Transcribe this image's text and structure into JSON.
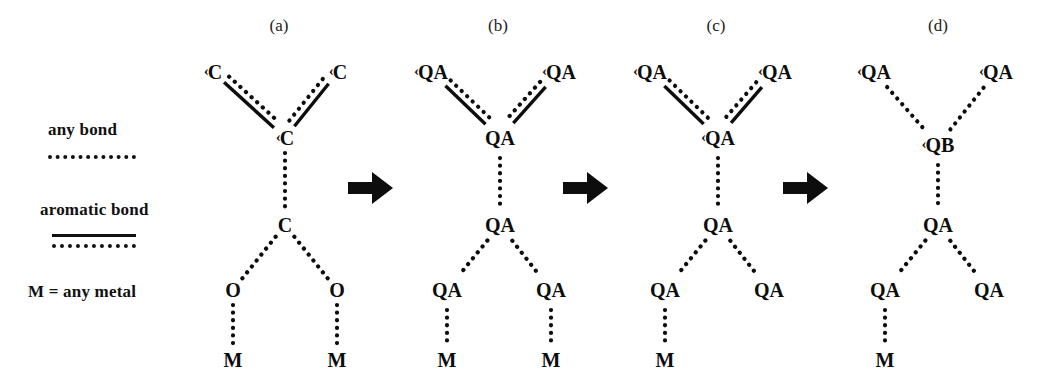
{
  "legend": {
    "any_bond_label": "any bond",
    "aromatic_bond_label": "aromatic bond",
    "metal_label": "M = any metal"
  },
  "panels": [
    {
      "label": "(a)"
    },
    {
      "label": "(b)"
    },
    {
      "label": "(c)"
    },
    {
      "label": "(d)"
    }
  ],
  "arrow_glyph": "arrow-right-icon",
  "colors": {
    "ink": "#0d0d0d",
    "background": "#ffffff"
  },
  "diagram": {
    "panel_a": {
      "label": "(a)",
      "nodes": [
        {
          "id": "tl",
          "text": "C",
          "tick": "‹",
          "x": 213,
          "y": 72
        },
        {
          "id": "tr",
          "text": "C",
          "tick": "‹",
          "x": 338,
          "y": 72
        },
        {
          "id": "mid",
          "text": "C",
          "tick": "‹",
          "x": 285,
          "y": 138
        },
        {
          "id": "ctr",
          "text": "C",
          "tick": "",
          "x": 285,
          "y": 225
        },
        {
          "id": "ol",
          "text": "O",
          "tick": "",
          "x": 233,
          "y": 290
        },
        {
          "id": "or",
          "text": "O",
          "tick": "",
          "x": 337,
          "y": 290
        },
        {
          "id": "ml",
          "text": "M",
          "tick": "",
          "x": 233,
          "y": 360
        },
        {
          "id": "mr",
          "text": "M",
          "tick": "",
          "x": 337,
          "y": 360
        }
      ],
      "bonds": [
        {
          "from": "tl",
          "to": "mid",
          "type": "aromatic"
        },
        {
          "from": "tr",
          "to": "mid",
          "type": "aromatic"
        },
        {
          "from": "mid",
          "to": "ctr",
          "type": "any"
        },
        {
          "from": "ctr",
          "to": "ol",
          "type": "any"
        },
        {
          "from": "ctr",
          "to": "or",
          "type": "any"
        },
        {
          "from": "ol",
          "to": "ml",
          "type": "any"
        },
        {
          "from": "or",
          "to": "mr",
          "type": "any"
        }
      ]
    },
    "panel_b": {
      "label": "(b)",
      "nodes": [
        {
          "id": "tl",
          "text": "QA",
          "tick": "‹",
          "x": 431,
          "y": 72
        },
        {
          "id": "tr",
          "text": "QA",
          "tick": "‹",
          "x": 559,
          "y": 72
        },
        {
          "id": "mid",
          "text": "QA",
          "tick": "",
          "x": 500,
          "y": 138
        },
        {
          "id": "ctr",
          "text": "QA",
          "tick": "",
          "x": 500,
          "y": 225
        },
        {
          "id": "ol",
          "text": "QA",
          "tick": "",
          "x": 447,
          "y": 290
        },
        {
          "id": "or",
          "text": "QA",
          "tick": "",
          "x": 551,
          "y": 290
        },
        {
          "id": "ml",
          "text": "M",
          "tick": "",
          "x": 447,
          "y": 360
        },
        {
          "id": "mr",
          "text": "M",
          "tick": "",
          "x": 551,
          "y": 360
        }
      ],
      "bonds": [
        {
          "from": "tl",
          "to": "mid",
          "type": "aromatic"
        },
        {
          "from": "tr",
          "to": "mid",
          "type": "aromatic"
        },
        {
          "from": "mid",
          "to": "ctr",
          "type": "any"
        },
        {
          "from": "ctr",
          "to": "ol",
          "type": "any"
        },
        {
          "from": "ctr",
          "to": "or",
          "type": "any"
        },
        {
          "from": "ol",
          "to": "ml",
          "type": "any"
        },
        {
          "from": "or",
          "to": "mr",
          "type": "any"
        }
      ]
    },
    "panel_c": {
      "label": "(c)",
      "nodes": [
        {
          "id": "tl",
          "text": "QA",
          "tick": "‹",
          "x": 650,
          "y": 72
        },
        {
          "id": "tr",
          "text": "QA",
          "tick": "‹",
          "x": 775,
          "y": 72
        },
        {
          "id": "mid",
          "text": "QA",
          "tick": "‹",
          "x": 718,
          "y": 138
        },
        {
          "id": "ctr",
          "text": "QA",
          "tick": "",
          "x": 718,
          "y": 225
        },
        {
          "id": "ol",
          "text": "QA",
          "tick": "",
          "x": 665,
          "y": 290
        },
        {
          "id": "or",
          "text": "QA",
          "tick": "",
          "x": 769,
          "y": 290
        },
        {
          "id": "ml",
          "text": "M",
          "tick": "",
          "x": 665,
          "y": 360
        }
      ],
      "bonds": [
        {
          "from": "tl",
          "to": "mid",
          "type": "aromatic"
        },
        {
          "from": "tr",
          "to": "mid",
          "type": "aromatic"
        },
        {
          "from": "mid",
          "to": "ctr",
          "type": "any"
        },
        {
          "from": "ctr",
          "to": "ol",
          "type": "any"
        },
        {
          "from": "ctr",
          "to": "or",
          "type": "any"
        },
        {
          "from": "ol",
          "to": "ml",
          "type": "any"
        }
      ]
    },
    "panel_d": {
      "label": "(d)",
      "nodes": [
        {
          "id": "tl",
          "text": "QA",
          "tick": "‹",
          "x": 874,
          "y": 72
        },
        {
          "id": "tr",
          "text": "QA",
          "tick": "‹",
          "x": 996,
          "y": 72
        },
        {
          "id": "mid",
          "text": "QB",
          "tick": "‹",
          "x": 938,
          "y": 145
        },
        {
          "id": "ctr",
          "text": "QA",
          "tick": "",
          "x": 938,
          "y": 225
        },
        {
          "id": "ol",
          "text": "QA",
          "tick": "",
          "x": 885,
          "y": 290
        },
        {
          "id": "or",
          "text": "QA",
          "tick": "",
          "x": 989,
          "y": 290
        },
        {
          "id": "ml",
          "text": "M",
          "tick": "",
          "x": 885,
          "y": 360
        }
      ],
      "bonds": [
        {
          "from": "tl",
          "to": "mid",
          "type": "any"
        },
        {
          "from": "tr",
          "to": "mid",
          "type": "any"
        },
        {
          "from": "mid",
          "to": "ctr",
          "type": "any"
        },
        {
          "from": "ctr",
          "to": "ol",
          "type": "any"
        },
        {
          "from": "ctr",
          "to": "or",
          "type": "any"
        },
        {
          "from": "ol",
          "to": "ml",
          "type": "any"
        }
      ]
    }
  },
  "arrows": [
    {
      "x": 371,
      "y": 190
    },
    {
      "x": 586,
      "y": 190
    },
    {
      "x": 806,
      "y": 190
    }
  ],
  "panel_label_positions": [
    {
      "label": "(a)",
      "x": 279,
      "y": 16
    },
    {
      "label": "(b)",
      "x": 498,
      "y": 16
    },
    {
      "label": "(c)",
      "x": 716,
      "y": 16
    },
    {
      "label": "(d)",
      "x": 938,
      "y": 16
    }
  ]
}
